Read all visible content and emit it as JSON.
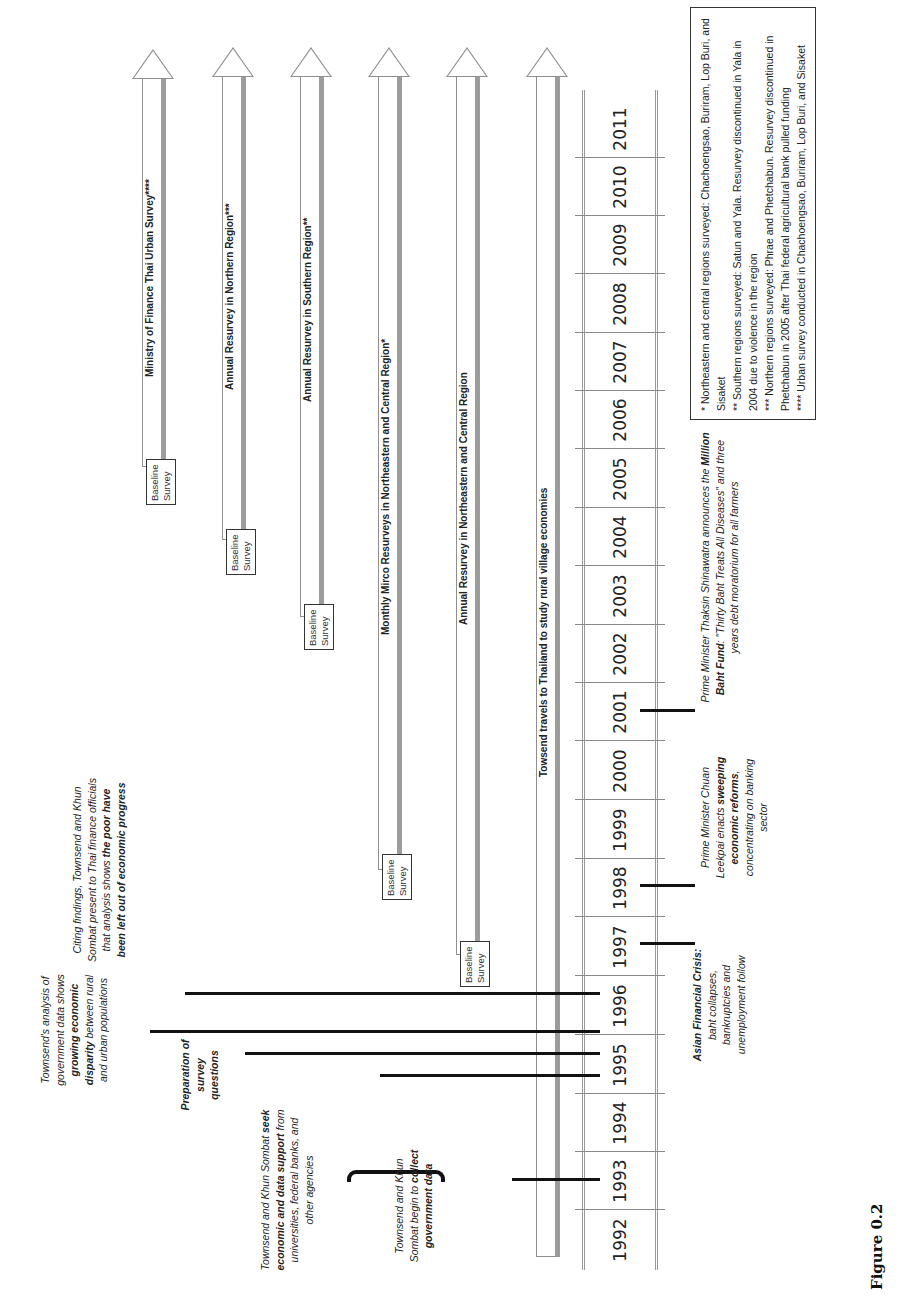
{
  "figure": {
    "caption": "Figure 0.2",
    "orientation": "rotated 90 degrees counter-clockwise"
  },
  "timeline": {
    "years": [
      "1992",
      "1993",
      "1994",
      "1995",
      "1996",
      "1997",
      "1998",
      "1999",
      "2000",
      "2001",
      "2002",
      "2003",
      "2004",
      "2005",
      "2006",
      "2007",
      "2008",
      "2009",
      "2010",
      "2011"
    ]
  },
  "surveys": [
    {
      "label": "Towsend travels to Thailand to study rural village economies",
      "start_year": "1992",
      "baseline": false
    },
    {
      "label": "Annual Resurvey in Northeastern and Central Region",
      "start_year": "1997",
      "baseline": true,
      "baseline_label": "Baseline Survey"
    },
    {
      "label": "Monthly Mirco Resurveys in Northeastern and Central Region*",
      "start_year": "1998",
      "baseline": true,
      "baseline_label": "Baseline Survey"
    },
    {
      "label": "Annual Resurvey in Southern Region**",
      "start_year": "2003",
      "baseline": true,
      "baseline_label": "Baseline Survey"
    },
    {
      "label": "Annual Resurvey in Northern Region***",
      "start_year": "2004",
      "baseline": true,
      "baseline_label": "Baseline Survey"
    },
    {
      "label": "Ministry of Finance Thai Urban Survey****",
      "start_year": "2005",
      "baseline": true,
      "baseline_label": "Baseline Survey"
    }
  ],
  "events_research": [
    {
      "year": "1993",
      "pre": "Townsend and Khun Sombat begin to ",
      "bold": "collect government data",
      "post": ""
    },
    {
      "year": "1995",
      "pre": "Townsend and Khun Sombat ",
      "bold": "seek economic and data support",
      "post": " from universities, federal banks, and other agencies"
    },
    {
      "year": "1995",
      "pre": "",
      "bold": "Preparation of survey questions",
      "post": ""
    },
    {
      "year": "1995",
      "pre": "Townsend's analysis of government data shows ",
      "bold": "growing economic disparity",
      "post": " between rural and urban populations"
    },
    {
      "year": "1996",
      "pre": "Citing findings, Townsend and Khun Sombat present to Thai finance officials that analysis shows ",
      "bold": "the poor have been left out of economic progress",
      "post": ""
    }
  ],
  "events_political": [
    {
      "year": "1997",
      "pre": "",
      "bold": "Asian Financial Crisis:",
      "post": " baht collapses, bankruptcies and unemployment follow"
    },
    {
      "year": "1998",
      "pre": "Prime Minister Chuan Leekpai enacts ",
      "bold": "sweeping economic reforms",
      "post": ", concentrating on banking sector"
    },
    {
      "year": "2001",
      "pre": "Prime Minister Thaksin Shinawatra announces the ",
      "bold": "Million Baht Fund",
      "post": ": \"Thirty Baht Treats All Diseases\" and three years debt moratorium for all farmers"
    }
  ],
  "footnotes": [
    "* Northeastern and central regions surveyed: Chachoengsao, Buriram, Lop Buri, and Sisaket",
    "** Southern regions surveyed: Satun and Yala. Resurvey discontinued in Yala in 2004 due to violence in the region",
    "*** Northern regions surveyed: Phrae and Phetchabun. Resurvey discontinued in Phetchabun in 2005 after Thai federal agricultural bank pulled funding",
    "**** Urban survey conducted in Chachoengsao, Buriram, Lop Buri, and Sisaket"
  ]
}
